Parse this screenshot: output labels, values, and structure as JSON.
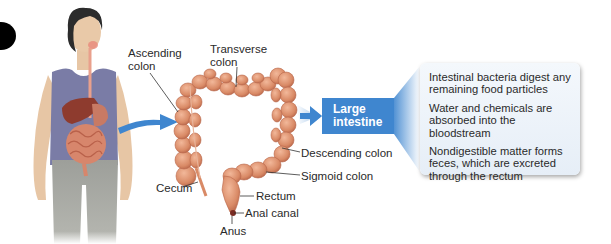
{
  "figure": {
    "type": "anatomy-diagram",
    "subject": "Large intestine",
    "colors": {
      "arrow_blue": "#3f86cf",
      "box_blue": "#3f86cf",
      "info_panel_bg": "#e9f0f8",
      "intestine": "#d98a66",
      "shirt": "#7a7ca6",
      "pants": "#a7a8a3",
      "skin": "#e9c9a8",
      "hair": "#2c2c2c"
    }
  },
  "labels": {
    "ascending_colon": [
      "Ascending",
      "colon"
    ],
    "transverse_colon": [
      "Transverse",
      "colon"
    ],
    "cecum": "Cecum",
    "descending_colon": "Descending colon",
    "sigmoid_colon": "Sigmoid colon",
    "rectum": "Rectum",
    "anal_canal": "Anal canal",
    "anus": "Anus"
  },
  "organ_box": {
    "label_line1": "Large",
    "label_line2": "intestine"
  },
  "functions": [
    "Intestinal bacteria digest any remaining food particles",
    "Water and chemicals are absorbed into the bloodstream",
    "Nondigestible matter forms feces, which are excreted through the rectum"
  ]
}
